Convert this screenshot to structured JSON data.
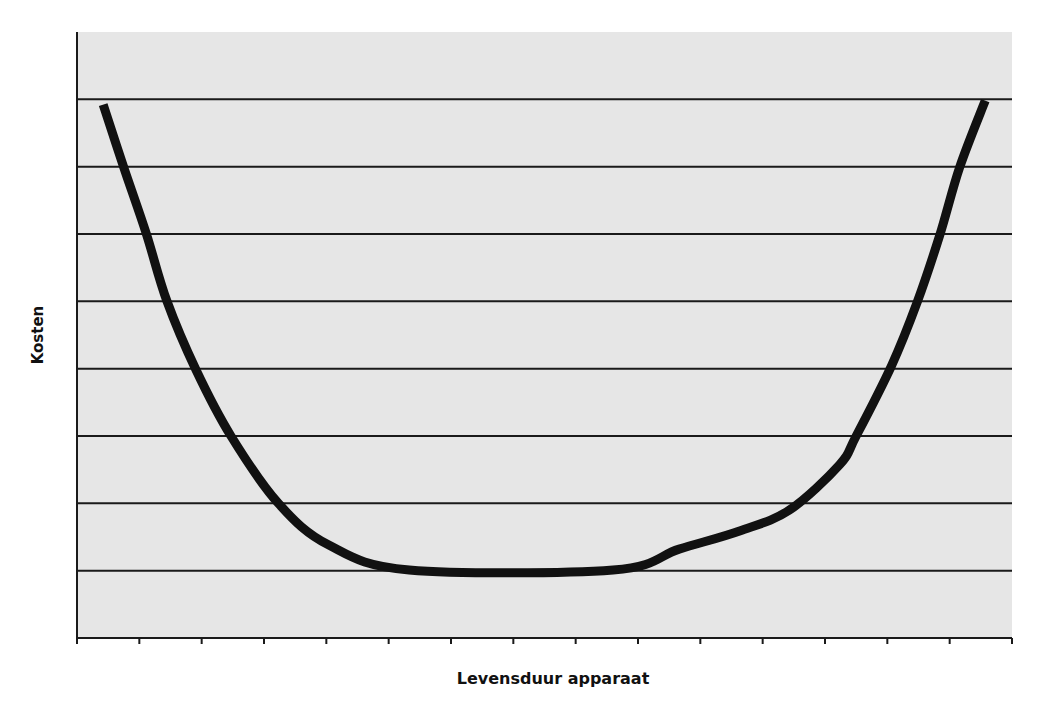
{
  "chart_data": {
    "type": "line",
    "title": "",
    "xlabel": "Levensduur apparaat",
    "ylabel": "Kosten",
    "xlim": [
      0,
      15
    ],
    "ylim": [
      0,
      9
    ],
    "x_tick_count": 16,
    "x_tick_labels": [],
    "y_tick_labels": [],
    "grid": {
      "horizontal": true,
      "vertical": false,
      "y_lines": [
        1,
        2,
        3,
        4,
        5,
        6,
        7,
        8
      ]
    },
    "legend": null,
    "background": "#e6e6e6",
    "series": [
      {
        "name": "Kosten",
        "color": "#111111",
        "line_width": 9,
        "x": [
          0.42,
          0.75,
          1.11,
          1.44,
          1.91,
          2.47,
          3.23,
          4.04,
          5.33,
          8.6,
          9.66,
          10.63,
          11.43,
          12.23,
          12.5,
          13.07,
          13.48,
          13.84,
          14.16,
          14.57
        ],
        "y": [
          7.92,
          6.99,
          6.01,
          5.01,
          3.98,
          3.0,
          2.0,
          1.38,
          1.01,
          1.01,
          1.32,
          1.59,
          1.9,
          2.57,
          3.0,
          4.05,
          4.99,
          5.98,
          6.99,
          7.98
        ]
      }
    ]
  },
  "labels": {
    "x_axis": "Levensduur apparaat",
    "y_axis": "Kosten"
  }
}
